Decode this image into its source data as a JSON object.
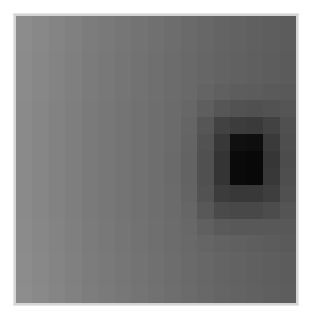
{
  "chart_data": {
    "type": "heatmap",
    "title": "",
    "xlabel": "",
    "ylabel": "",
    "colormap": "grayscale",
    "grid": false,
    "legend": "none",
    "rows": 17,
    "cols": 17,
    "value_range": [
      0,
      255
    ],
    "values": [
      [
        140,
        136,
        132,
        128,
        124,
        121,
        118,
        115,
        112,
        109,
        106,
        103,
        100,
        98,
        96,
        94,
        92
      ],
      [
        140,
        136,
        132,
        128,
        124,
        121,
        118,
        115,
        112,
        109,
        106,
        103,
        100,
        98,
        96,
        94,
        92
      ],
      [
        139,
        135,
        131,
        127,
        123,
        120,
        117,
        114,
        111,
        108,
        105,
        102,
        99,
        97,
        95,
        93,
        91
      ],
      [
        139,
        135,
        131,
        127,
        123,
        120,
        117,
        114,
        111,
        108,
        105,
        102,
        99,
        97,
        95,
        93,
        91
      ],
      [
        139,
        135,
        131,
        127,
        123,
        120,
        117,
        114,
        111,
        108,
        105,
        100,
        96,
        93,
        92,
        90,
        89
      ],
      [
        138,
        134,
        130,
        126,
        122,
        119,
        116,
        113,
        110,
        107,
        103,
        94,
        86,
        82,
        80,
        82,
        85
      ],
      [
        138,
        134,
        130,
        126,
        122,
        119,
        116,
        113,
        110,
        107,
        101,
        86,
        66,
        60,
        58,
        66,
        80
      ],
      [
        138,
        134,
        130,
        126,
        122,
        119,
        116,
        113,
        110,
        107,
        100,
        82,
        56,
        16,
        14,
        58,
        78
      ],
      [
        138,
        134,
        130,
        126,
        122,
        119,
        116,
        113,
        110,
        106,
        99,
        80,
        52,
        10,
        8,
        54,
        76
      ],
      [
        138,
        134,
        130,
        126,
        122,
        119,
        116,
        113,
        110,
        106,
        99,
        80,
        52,
        10,
        8,
        56,
        78
      ],
      [
        138,
        134,
        130,
        126,
        122,
        119,
        116,
        113,
        110,
        107,
        100,
        82,
        60,
        56,
        56,
        62,
        80
      ],
      [
        138,
        134,
        130,
        126,
        122,
        119,
        116,
        113,
        110,
        107,
        102,
        88,
        74,
        72,
        72,
        76,
        84
      ],
      [
        139,
        135,
        131,
        127,
        123,
        120,
        117,
        114,
        111,
        108,
        104,
        96,
        90,
        88,
        88,
        88,
        88
      ],
      [
        139,
        135,
        131,
        127,
        123,
        120,
        117,
        114,
        111,
        108,
        105,
        101,
        98,
        96,
        94,
        92,
        90
      ],
      [
        140,
        136,
        132,
        128,
        124,
        121,
        118,
        115,
        112,
        109,
        106,
        103,
        100,
        98,
        96,
        94,
        92
      ],
      [
        140,
        136,
        132,
        128,
        124,
        121,
        118,
        115,
        112,
        109,
        106,
        103,
        100,
        98,
        96,
        94,
        92
      ],
      [
        141,
        137,
        133,
        129,
        125,
        122,
        119,
        116,
        113,
        110,
        107,
        104,
        101,
        99,
        97,
        95,
        93
      ]
    ]
  },
  "frame": {
    "border_color": "#d4d4d4",
    "background": "#ffffff"
  }
}
